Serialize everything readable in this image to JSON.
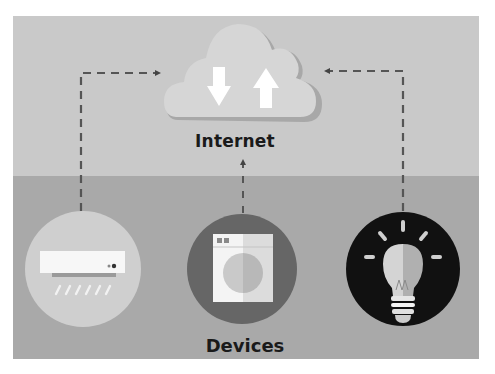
{
  "diagram": {
    "title_top": "Internet",
    "title_bottom": "Devices",
    "colors": {
      "top_panel": "#c9c9c9",
      "bottom_panel": "#a9a9a9",
      "cloud": "#d6d6d6",
      "cloud_shadow": "#a8a8a8",
      "arrow_fill": "#ffffff",
      "connector": "#555555",
      "ac_circle": "#cfcfcf",
      "washer_circle": "#666666",
      "bulb_circle": "#111111"
    },
    "nodes": [
      {
        "id": "internet",
        "label": "Internet",
        "icon": "cloud-upload-download-icon"
      },
      {
        "id": "air-conditioner",
        "icon": "air-conditioner-icon"
      },
      {
        "id": "washing-machine",
        "icon": "washing-machine-icon"
      },
      {
        "id": "light-bulb",
        "icon": "light-bulb-icon"
      }
    ],
    "connections": [
      {
        "from": "air-conditioner",
        "to": "internet",
        "style": "dashed-arrow"
      },
      {
        "from": "washing-machine",
        "to": "internet",
        "style": "dashed-arrow"
      },
      {
        "from": "light-bulb",
        "to": "internet",
        "style": "dashed-arrow"
      }
    ]
  }
}
